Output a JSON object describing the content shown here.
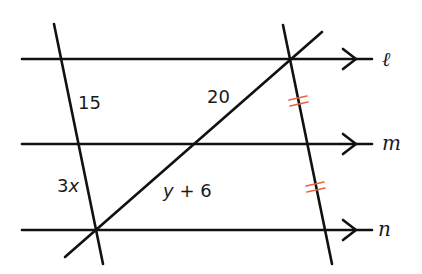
{
  "diagram": {
    "parallel_lines": [
      {
        "name": "l",
        "label": "ℓ",
        "y": 59
      },
      {
        "name": "m",
        "label": "m",
        "y": 144
      },
      {
        "name": "n",
        "label": "n",
        "y": 230
      }
    ],
    "segment_labels": {
      "left_upper": "15",
      "left_lower_coef": "3",
      "left_lower_var": "x",
      "diagonal_upper": "20",
      "diagonal_lower_var": "y",
      "diagonal_lower_rest": " + 6"
    },
    "congruence_marks": {
      "style": "double-tick",
      "count": 2,
      "color": "#e8643c"
    },
    "colors": {
      "line": "#111111",
      "tick": "#e8643c",
      "text": "#1a1a1a",
      "background": "#ffffff"
    }
  }
}
